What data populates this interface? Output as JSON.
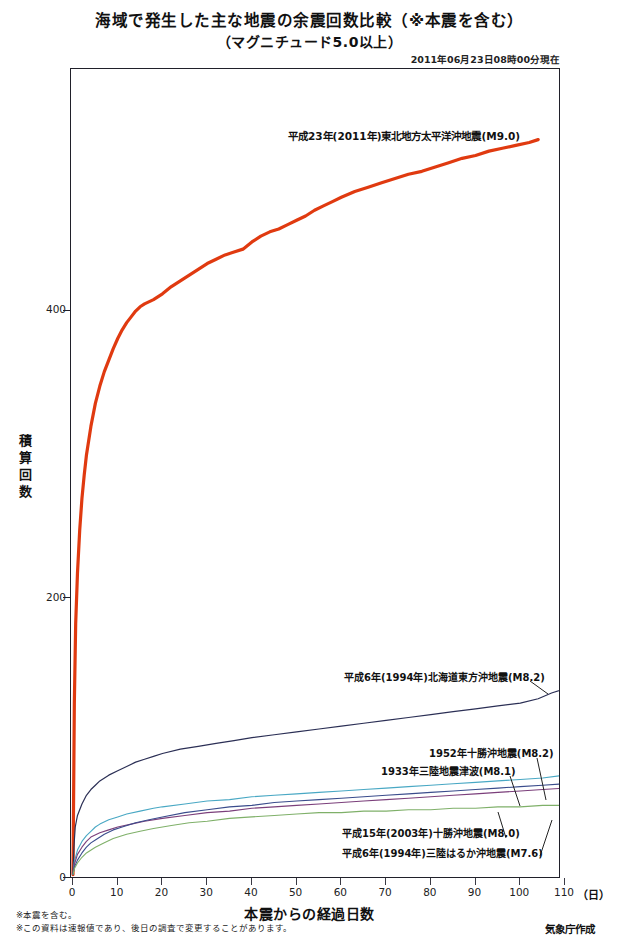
{
  "header": {
    "title_line1": "海域で発生した主な地震の余震回数比較（※本震を含む）",
    "title_line2": "（マグニチュード5.0以上）",
    "datestamp": "2011年06月23日08時00分現在"
  },
  "footer": {
    "note1": "※本震を含む。",
    "note2": "※この資料は速報値であり、後日の調査で変更することがあります。",
    "credit": "気象庁作成"
  },
  "axes": {
    "ylabel_chars": [
      "積",
      "算",
      "回",
      "数"
    ],
    "ylabel": "積算回数",
    "yticks": [
      "0",
      "200",
      "400"
    ],
    "ytick_values": [
      0,
      200,
      400
    ],
    "ylim": [
      0,
      560
    ],
    "xlabel": "本震からの経過日数",
    "xunit": "（日）",
    "xticks": [
      "0",
      "10",
      "20",
      "30",
      "40",
      "50",
      "60",
      "70",
      "80",
      "90",
      "100",
      "110"
    ],
    "xtick_values": [
      0,
      10,
      20,
      30,
      40,
      50,
      60,
      70,
      80,
      90,
      100,
      110
    ],
    "xlim": [
      0,
      110
    ]
  },
  "annotations": {
    "main": "平成23年(2011年)東北地方太平洋沖地震(M9.0)",
    "hokkaido": "平成6年(1994年)北海道東方沖地震(M8.2)",
    "tokachi1952": "1952年十勝沖地震(M8.2)",
    "sanriku1933": "1933年三陸地震津波(M8.1)",
    "tokachi2003": "平成15年(2003年)十勝沖地震(M8.0)",
    "sanriku1994": "平成6年(1994年)三陸はるか沖地震(M7.6)"
  },
  "chart_data": {
    "type": "line",
    "subtitle": "2011年06月23日08時00分現在",
    "xlabel": "本震からの経過日数",
    "ylabel": "積算回数",
    "xlim": [
      0,
      110
    ],
    "ylim": [
      0,
      560
    ],
    "grid": false,
    "legend": "inline-annotations",
    "series": [
      {
        "name": "平成23年(2011年)東北地方太平洋沖地震(M9.0)",
        "color": "#E03A10",
        "width": 3.2,
        "x": [
          0,
          0.3,
          0.6,
          1,
          1.5,
          2,
          2.5,
          3,
          4,
          5,
          6,
          7,
          8,
          9,
          10,
          11,
          12,
          13,
          14,
          15,
          16,
          18,
          20,
          22,
          24,
          26,
          28,
          30,
          32,
          34,
          36,
          38,
          40,
          42,
          44,
          46,
          48,
          50,
          52,
          54,
          56,
          58,
          60,
          63,
          66,
          69,
          72,
          75,
          78,
          81,
          84,
          87,
          90,
          93,
          96,
          99,
          102,
          104
        ],
        "y": [
          1,
          120,
          175,
          210,
          240,
          262,
          278,
          292,
          312,
          328,
          340,
          350,
          358,
          366,
          373,
          379,
          384,
          388,
          392,
          395,
          397,
          400,
          404,
          409,
          413,
          417,
          421,
          425,
          428,
          431,
          433,
          435,
          440,
          444,
          447,
          449,
          452,
          455,
          458,
          462,
          465,
          468,
          471,
          475,
          478,
          481,
          484,
          487,
          489,
          492,
          495,
          498,
          500,
          503,
          505,
          507,
          509,
          511
        ]
      },
      {
        "name": "平成6年(1994年)北海道東方沖地震(M8.2)",
        "color": "#2B2F55",
        "width": 1.2,
        "x": [
          0,
          0.2,
          0.5,
          1,
          2,
          3,
          4,
          5,
          6,
          8,
          10,
          12,
          14,
          16,
          18,
          20,
          24,
          28,
          32,
          36,
          40,
          45,
          50,
          55,
          60,
          65,
          70,
          75,
          80,
          85,
          90,
          95,
          100,
          104,
          107,
          110
        ],
        "y": [
          1,
          20,
          34,
          42,
          50,
          56,
          60,
          63,
          66,
          70,
          73,
          76,
          79,
          81,
          83,
          85,
          88,
          90,
          92,
          94,
          96,
          98,
          100,
          102,
          104,
          106,
          108,
          110,
          112,
          114,
          116,
          118,
          120,
          123,
          127,
          130
        ]
      },
      {
        "name": "1952年十勝沖地震(M8.2)",
        "color": "#49A8C4",
        "width": 1.1,
        "x": [
          0,
          0.3,
          1,
          2,
          3,
          4,
          5,
          6,
          8,
          10,
          12,
          15,
          18,
          20,
          25,
          30,
          35,
          40,
          45,
          50,
          55,
          60,
          65,
          70,
          75,
          80,
          85,
          90,
          95,
          100,
          105,
          110
        ],
        "y": [
          1,
          10,
          18,
          24,
          28,
          31,
          34,
          36,
          39,
          41,
          43,
          45,
          47,
          48,
          50,
          52,
          53,
          55,
          56,
          57,
          58,
          59,
          60,
          61,
          62,
          63,
          64,
          65,
          66,
          67,
          68,
          70
        ]
      },
      {
        "name": "1933年三陸地震津波(M8.1)",
        "color": "#7B3F7B",
        "width": 1.1,
        "x": [
          0,
          0.3,
          1,
          2,
          3,
          4,
          6,
          8,
          10,
          13,
          16,
          20,
          25,
          30,
          35,
          40,
          45,
          50,
          55,
          60,
          65,
          70,
          75,
          80,
          85,
          90,
          95,
          100,
          105,
          110
        ],
        "y": [
          1,
          8,
          15,
          20,
          24,
          27,
          30,
          32,
          34,
          36,
          38,
          40,
          42,
          44,
          45,
          47,
          48,
          49,
          50,
          51,
          52,
          53,
          54,
          55,
          56,
          57,
          58,
          59,
          60,
          61
        ]
      },
      {
        "name": "平成15年(2003年)十勝沖地震(M8.0)",
        "color": "#3A4C8C",
        "width": 1.1,
        "x": [
          0,
          0.3,
          1,
          2,
          3,
          4,
          5,
          7,
          9,
          11,
          14,
          17,
          20,
          25,
          30,
          35,
          40,
          45,
          50,
          55,
          60,
          65,
          70,
          75,
          80,
          85,
          90,
          95,
          100,
          105,
          110
        ],
        "y": [
          1,
          6,
          11,
          16,
          20,
          23,
          25,
          29,
          32,
          34,
          37,
          39,
          41,
          44,
          46,
          48,
          49,
          51,
          52,
          53,
          54,
          55,
          56,
          57,
          58,
          59,
          60,
          61,
          62,
          63,
          64
        ]
      },
      {
        "name": "平成6年(1994年)三陸はるか沖地震(M7.6)",
        "color": "#7FB069",
        "width": 1.1,
        "x": [
          0,
          0.3,
          1,
          2,
          3,
          5,
          7,
          9,
          12,
          15,
          18,
          22,
          26,
          30,
          35,
          40,
          45,
          50,
          55,
          60,
          65,
          70,
          75,
          80,
          85,
          90,
          95,
          100,
          105,
          110
        ],
        "y": [
          1,
          5,
          9,
          13,
          16,
          20,
          23,
          26,
          29,
          31,
          33,
          35,
          37,
          38,
          40,
          41,
          42,
          43,
          44,
          44,
          45,
          45,
          46,
          46,
          47,
          47,
          48,
          48,
          49,
          49
        ]
      }
    ]
  }
}
